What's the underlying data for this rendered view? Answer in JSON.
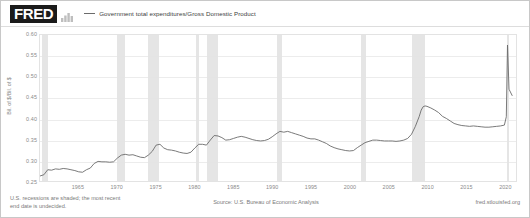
{
  "header": {
    "logo_text": "FRED",
    "logo_mark_icon": "bar-chart-icon",
    "legend_label": "Government total expenditures/Gross Domestic Product"
  },
  "footer": {
    "footnote_line1": "U.S. recessions are shaded; the most recent",
    "footnote_line2": "end date is undecided.",
    "source": "Source: U.S. Bureau of Economic Analysis",
    "attribution": "fred.stlouisfed.org"
  },
  "chart_data": {
    "type": "line",
    "title": "Government total expenditures/Gross Domestic Product",
    "xlabel": "",
    "ylabel": "Bil. of $/Bil. of $",
    "ylim": [
      0.25,
      0.6
    ],
    "xlim": [
      1960,
      2021.5
    ],
    "grid": true,
    "legend_position": "top",
    "line_color": "#6b6b6b",
    "recession_color": "#e4e4e4",
    "yticks": [
      0.6,
      0.55,
      0.5,
      0.45,
      0.4,
      0.35,
      0.3,
      0.25
    ],
    "ytick_labels": [
      "0.60",
      "0.55",
      "0.50",
      "0.45",
      "0.40",
      "0.35",
      "0.30",
      "0.25"
    ],
    "xticks": [
      1965,
      1970,
      1975,
      1980,
      1985,
      1990,
      1995,
      2000,
      2005,
      2010,
      2015,
      2020
    ],
    "xtick_labels": [
      "1965",
      "1970",
      "1975",
      "1980",
      "1985",
      "1990",
      "1995",
      "2000",
      "2005",
      "2010",
      "2015",
      "2020"
    ],
    "recessions": [
      {
        "start": 1960.25,
        "end": 1961.08
      },
      {
        "start": 1969.92,
        "end": 1970.92
      },
      {
        "start": 1973.92,
        "end": 1975.25
      },
      {
        "start": 1980.08,
        "end": 1980.5
      },
      {
        "start": 1981.5,
        "end": 1982.92
      },
      {
        "start": 1990.5,
        "end": 1991.17
      },
      {
        "start": 2001.25,
        "end": 2001.92
      },
      {
        "start": 2007.92,
        "end": 2009.5
      },
      {
        "start": 2020.08,
        "end": 2020.33
      }
    ],
    "series": [
      {
        "name": "Government total expenditures/Gross Domestic Product",
        "x": [
          1960.0,
          1960.5,
          1961.0,
          1961.5,
          1962.0,
          1962.5,
          1963.0,
          1963.5,
          1964.0,
          1964.5,
          1965.0,
          1965.5,
          1966.0,
          1966.5,
          1967.0,
          1967.5,
          1968.0,
          1968.5,
          1969.0,
          1969.5,
          1970.0,
          1970.5,
          1971.0,
          1971.5,
          1972.0,
          1972.5,
          1973.0,
          1973.5,
          1974.0,
          1974.5,
          1975.0,
          1975.5,
          1976.0,
          1976.5,
          1977.0,
          1977.5,
          1978.0,
          1978.5,
          1979.0,
          1979.5,
          1980.0,
          1980.5,
          1981.0,
          1981.5,
          1982.0,
          1982.5,
          1983.0,
          1983.5,
          1984.0,
          1984.5,
          1985.0,
          1985.5,
          1986.0,
          1986.5,
          1987.0,
          1987.5,
          1988.0,
          1988.5,
          1989.0,
          1989.5,
          1990.0,
          1990.5,
          1991.0,
          1991.5,
          1992.0,
          1992.5,
          1993.0,
          1993.5,
          1994.0,
          1994.5,
          1995.0,
          1995.5,
          1996.0,
          1996.5,
          1997.0,
          1997.5,
          1998.0,
          1998.5,
          1999.0,
          1999.5,
          2000.0,
          2000.5,
          2001.0,
          2001.5,
          2002.0,
          2002.5,
          2003.0,
          2003.5,
          2004.0,
          2004.5,
          2005.0,
          2005.5,
          2006.0,
          2006.5,
          2007.0,
          2007.5,
          2008.0,
          2008.5,
          2009.0,
          2009.25,
          2009.5,
          2009.75,
          2010.0,
          2010.5,
          2011.0,
          2011.5,
          2012.0,
          2012.5,
          2013.0,
          2013.5,
          2014.0,
          2014.5,
          2015.0,
          2015.5,
          2016.0,
          2016.5,
          2017.0,
          2017.5,
          2018.0,
          2018.5,
          2019.0,
          2019.5,
          2020.0,
          2020.25,
          2020.4,
          2020.6,
          2021.0
        ],
        "y": [
          0.262,
          0.265,
          0.277,
          0.276,
          0.279,
          0.278,
          0.28,
          0.279,
          0.277,
          0.275,
          0.272,
          0.271,
          0.277,
          0.281,
          0.292,
          0.297,
          0.296,
          0.296,
          0.295,
          0.296,
          0.305,
          0.312,
          0.314,
          0.312,
          0.313,
          0.31,
          0.307,
          0.306,
          0.312,
          0.321,
          0.336,
          0.338,
          0.329,
          0.325,
          0.324,
          0.322,
          0.319,
          0.317,
          0.316,
          0.319,
          0.329,
          0.338,
          0.338,
          0.336,
          0.348,
          0.359,
          0.358,
          0.354,
          0.348,
          0.349,
          0.352,
          0.355,
          0.357,
          0.355,
          0.352,
          0.349,
          0.347,
          0.346,
          0.347,
          0.35,
          0.356,
          0.363,
          0.369,
          0.367,
          0.369,
          0.366,
          0.363,
          0.36,
          0.357,
          0.353,
          0.351,
          0.351,
          0.348,
          0.344,
          0.34,
          0.334,
          0.33,
          0.327,
          0.325,
          0.323,
          0.322,
          0.323,
          0.33,
          0.336,
          0.342,
          0.345,
          0.348,
          0.348,
          0.347,
          0.346,
          0.346,
          0.346,
          0.345,
          0.346,
          0.348,
          0.352,
          0.362,
          0.381,
          0.405,
          0.42,
          0.428,
          0.43,
          0.429,
          0.425,
          0.42,
          0.414,
          0.405,
          0.4,
          0.394,
          0.388,
          0.385,
          0.383,
          0.382,
          0.381,
          0.382,
          0.381,
          0.38,
          0.379,
          0.379,
          0.38,
          0.381,
          0.382,
          0.384,
          0.404,
          0.576,
          0.47,
          0.455
        ]
      }
    ]
  }
}
